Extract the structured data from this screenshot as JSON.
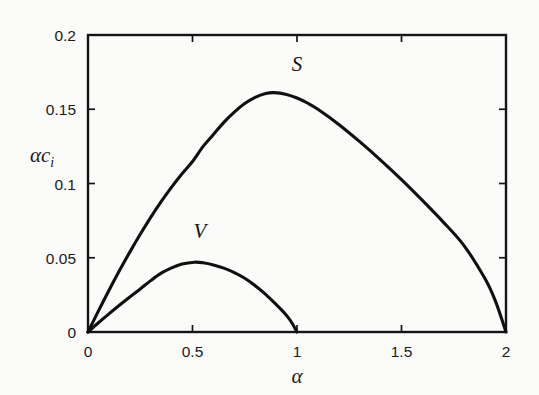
{
  "chart_data": {
    "type": "line",
    "title": "",
    "xlabel": "α",
    "ylabel": "αc_i",
    "ylabel_base": "αc",
    "ylabel_sub": "i",
    "xlim": [
      0,
      2
    ],
    "ylim": [
      0,
      0.2
    ],
    "xticks": [
      0,
      0.5,
      1,
      1.5,
      2
    ],
    "xticklabels": [
      "0",
      "0.5",
      "1",
      "1.5",
      "2"
    ],
    "yticks": [
      0,
      0.05,
      0.1,
      0.15,
      0.2
    ],
    "yticklabels": [
      "0",
      "0.05",
      "0.1",
      "0.15",
      "0.2"
    ],
    "grid": false,
    "legend": "inline-curve-labels",
    "frame": "box-with-inward-ticks",
    "series": [
      {
        "name": "S",
        "label": "S",
        "label_x": 1.0,
        "label_y": 0.1755,
        "color": "#101010",
        "x": [
          0,
          0.05,
          0.1,
          0.15,
          0.2,
          0.25,
          0.3,
          0.35,
          0.4,
          0.45,
          0.5,
          0.55,
          0.6,
          0.65,
          0.7,
          0.75,
          0.8,
          0.85,
          0.89,
          0.95,
          1.0,
          1.05,
          1.1,
          1.2,
          1.3,
          1.4,
          1.5,
          1.6,
          1.7,
          1.8,
          1.9,
          1.95,
          2.0
        ],
        "y": [
          0,
          0.0142,
          0.028,
          0.0412,
          0.0538,
          0.0658,
          0.0772,
          0.0878,
          0.0976,
          0.1066,
          0.1148,
          0.1248,
          0.133,
          0.1412,
          0.148,
          0.1538,
          0.158,
          0.1606,
          0.1612,
          0.16,
          0.1576,
          0.1542,
          0.15,
          0.1398,
          0.1282,
          0.1158,
          0.1026,
          0.0886,
          0.074,
          0.058,
          0.0358,
          0.0206,
          0
        ]
      },
      {
        "name": "V",
        "label": "V",
        "label_x": 0.535,
        "label_y": 0.0636,
        "color": "#101010",
        "x": [
          0,
          0.05,
          0.1,
          0.15,
          0.2,
          0.25,
          0.3,
          0.35,
          0.4,
          0.45,
          0.51,
          0.55,
          0.6,
          0.65,
          0.7,
          0.75,
          0.8,
          0.85,
          0.9,
          0.94,
          0.97,
          1.0
        ],
        "y": [
          0,
          0.0062,
          0.0122,
          0.018,
          0.0236,
          0.029,
          0.0346,
          0.0396,
          0.0432,
          0.0458,
          0.047,
          0.0466,
          0.0452,
          0.043,
          0.04,
          0.0362,
          0.0312,
          0.0254,
          0.0186,
          0.0128,
          0.0074,
          0
        ]
      }
    ]
  },
  "colors": {
    "background": "#fbfbfa",
    "axis": "#141414",
    "curve": "#101010",
    "text": "#1a1a1a"
  }
}
